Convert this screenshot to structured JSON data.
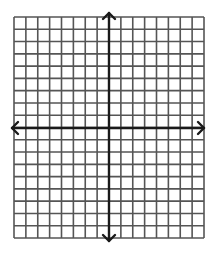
{
  "diagram": {
    "type": "coordinate-plane",
    "grid": {
      "columns": 16,
      "rows": 18,
      "left": 14,
      "top": 17,
      "width": 190,
      "height": 221,
      "line_color": "#555555",
      "line_width": 1.6
    },
    "axes": {
      "color": "#1a1a1a",
      "width": 2.4,
      "x_axis": {
        "y": 128,
        "x_start": 12,
        "x_end": 204,
        "arrows": [
          "left",
          "right"
        ]
      },
      "y_axis": {
        "x": 109,
        "y_start": 13,
        "y_end": 241,
        "arrows": [
          "up",
          "down"
        ]
      }
    },
    "background": "#ffffff"
  }
}
